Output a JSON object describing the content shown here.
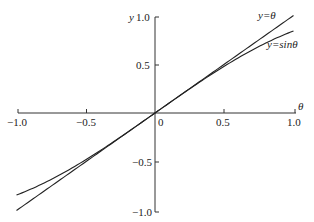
{
  "chart_data": {
    "type": "line",
    "title": "",
    "xlabel": "θ",
    "ylabel": "y",
    "xlim": [
      -1.0,
      1.0
    ],
    "ylim": [
      -1.0,
      1.0
    ],
    "xticks": [
      "-1.0",
      "-0.5",
      "0",
      "0.5",
      "1.0"
    ],
    "yticks": [
      "1.0",
      "0.5",
      "-0.5",
      "-1.0"
    ],
    "grid": false,
    "series": [
      {
        "name": "y=θ",
        "label": "y=θ",
        "function": "theta",
        "x": [
          -1.0,
          -0.5,
          0,
          0.5,
          1.0
        ],
        "values": [
          -1.0,
          -0.5,
          0,
          0.5,
          1.0
        ]
      },
      {
        "name": "y=sinθ",
        "label": "y=sinθ",
        "function": "sin",
        "x": [
          -1.0,
          -0.5,
          0,
          0.5,
          1.0
        ],
        "values": [
          -0.841,
          -0.479,
          0,
          0.479,
          0.841
        ]
      }
    ],
    "annotations": [
      "y=θ",
      "y=sinθ"
    ]
  },
  "labels": {
    "y_axis": "y",
    "x_axis": "θ",
    "origin": "0",
    "x_neg1": "−1.0",
    "x_neg05": "−0.5",
    "x_05": "0.5",
    "x_1": "1.0",
    "y_1": "1.0",
    "y_05": "0.5",
    "y_neg05": "−0.5",
    "y_neg1": "−1.0",
    "curve_theta": "y=θ",
    "curve_sin": "y=sinθ"
  }
}
